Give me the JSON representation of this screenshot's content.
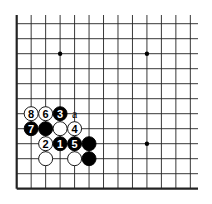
{
  "diagram": {
    "type": "go-board-partial",
    "grid": {
      "x0": 16.7,
      "dx": 14.47,
      "cols": 13,
      "x_extend": 198,
      "y0": 23.7,
      "dy": 15.0,
      "rows": 12,
      "y_top_extend": 15,
      "left_edge": true,
      "bottom_edge": true
    },
    "colors": {
      "black": "#000000",
      "white": "#ffffff",
      "line": "#222222"
    },
    "star_points": [
      {
        "col": 3,
        "row": 2
      },
      {
        "col": 9,
        "row": 2
      },
      {
        "col": 9,
        "row": 8
      }
    ],
    "stones": [
      {
        "col": 1,
        "row": 6,
        "color": "white",
        "label": "8"
      },
      {
        "col": 2,
        "row": 6,
        "color": "white",
        "label": "6"
      },
      {
        "col": 3,
        "row": 6,
        "color": "black",
        "label": "3"
      },
      {
        "col": 1,
        "row": 7,
        "color": "black",
        "label": "7"
      },
      {
        "col": 2,
        "row": 7,
        "color": "black",
        "label": ""
      },
      {
        "col": 3,
        "row": 7,
        "color": "white",
        "label": ""
      },
      {
        "col": 4,
        "row": 7,
        "color": "white",
        "label": "4"
      },
      {
        "col": 2,
        "row": 8,
        "color": "white",
        "label": "2"
      },
      {
        "col": 3,
        "row": 8,
        "color": "black",
        "label": "1"
      },
      {
        "col": 4,
        "row": 8,
        "color": "black",
        "label": "5"
      },
      {
        "col": 5,
        "row": 8,
        "color": "black",
        "label": ""
      },
      {
        "col": 2,
        "row": 9,
        "color": "white",
        "label": ""
      },
      {
        "col": 4,
        "row": 9,
        "color": "white",
        "label": ""
      },
      {
        "col": 5,
        "row": 9,
        "color": "black",
        "label": ""
      }
    ],
    "markers": [
      {
        "col": 4,
        "row": 6,
        "label": "a"
      }
    ]
  }
}
